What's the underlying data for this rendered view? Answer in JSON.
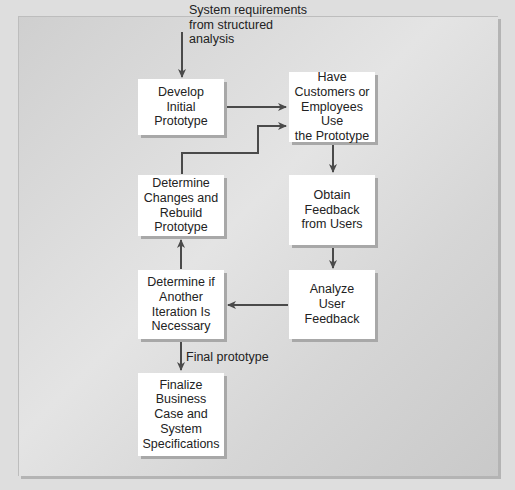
{
  "diagram": {
    "type": "flowchart",
    "title": "",
    "colors": {
      "background": "#dedede",
      "panel": "#dcdcdc",
      "box_fill": "#ffffff",
      "box_shadow": "#a8a8a8",
      "arrow": "#4a4a4a",
      "text": "#222222"
    },
    "input_label": "System requirements\nfrom structured\nanalysis",
    "output_label": "Final prototype",
    "nodes": [
      {
        "id": "develop",
        "label": "Develop\nInitial\nPrototype"
      },
      {
        "id": "use",
        "label": "Have\nCustomers or\nEmployees Use\nthe Prototype"
      },
      {
        "id": "feedback",
        "label": "Obtain\nFeedback\nfrom Users"
      },
      {
        "id": "analyze",
        "label": "Analyze\nUser\nFeedback"
      },
      {
        "id": "iterate",
        "label": "Determine if\nAnother\nIteration Is\nNecessary"
      },
      {
        "id": "rebuild",
        "label": "Determine\nChanges and\nRebuild\nPrototype"
      },
      {
        "id": "finalize",
        "label": "Finalize\nBusiness\nCase and\nSystem\nSpecifications"
      }
    ],
    "edges": [
      {
        "from": "input",
        "to": "develop",
        "label": "System requirements from structured analysis"
      },
      {
        "from": "develop",
        "to": "use"
      },
      {
        "from": "use",
        "to": "feedback"
      },
      {
        "from": "feedback",
        "to": "analyze"
      },
      {
        "from": "analyze",
        "to": "iterate"
      },
      {
        "from": "iterate",
        "to": "rebuild"
      },
      {
        "from": "rebuild",
        "to": "use"
      },
      {
        "from": "iterate",
        "to": "finalize",
        "label": "Final prototype"
      }
    ]
  }
}
